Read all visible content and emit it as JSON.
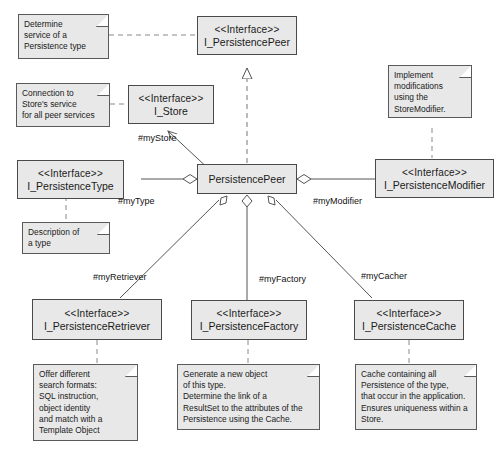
{
  "diagram": {
    "background": "#ffffff",
    "node_fill": "#e8e8e8",
    "node_stroke": "#4a4a4a",
    "stereotype": "<<Interface>>",
    "nodes": {
      "persistence_peer_iface": "I_PersistencePeer",
      "store_iface": "I_Store",
      "persistence_type_iface": "I_PersistenceType",
      "persistence_modifier_iface": "I_PersistenceModifier",
      "persistence_peer_class": "PersistencePeer",
      "persistence_retriever_iface": "I_PersistenceRetriever",
      "persistence_factory_iface": "I_PersistenceFactory",
      "persistence_cache_iface": "I_PersistenceCache"
    },
    "notes": {
      "determine_service": "Determine\nservice of a\nPersistence type",
      "connection_store": "Connection to\nStore's service\nfor all peer services",
      "implement_modifications": "Implement\nmodifications\nusing the\nStoreModifier.",
      "description_type": "Description of\na type",
      "retriever_note": "Offer different\nsearch formats:\nSQL instruction,\nobject identity\nand match with a\nTemplate Object",
      "factory_note": "Generate a new object\nof this type.\nDetermine the link of a\nResultSet to the attributes of the\nPersistence using the Cache.",
      "cache_note": "Cache containing all\nPersistence of the type,\nthat occur in the application.\nEnsures uniqueness within a\nStore."
    },
    "edge_labels": {
      "my_store": "#myStore",
      "my_type": "#myType",
      "my_modifier": "#myModifier",
      "my_retriever": "#myRetriever",
      "my_factory": "#myFactory",
      "my_cacher": "#myCacher"
    }
  }
}
